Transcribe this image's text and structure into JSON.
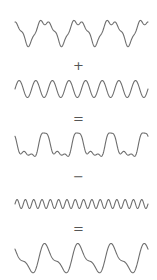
{
  "diagram": {
    "stroke_color": "#6e6e6e",
    "operator_color": "#555555",
    "x_start": 15,
    "x_end": 148,
    "waves": [
      {
        "id": "wave-1",
        "y_center": 31,
        "components": [
          {
            "periods": 4,
            "amp": 11,
            "phase": 0.35
          },
          {
            "periods": 8,
            "amp": 3,
            "phase": 0.9
          },
          {
            "periods": 16,
            "amp": 2,
            "phase": 0.2
          }
        ]
      },
      {
        "id": "wave-2",
        "y_center": 89,
        "components": [
          {
            "periods": 8,
            "amp": 8.5,
            "phase": 0.0
          }
        ]
      },
      {
        "id": "wave-3",
        "y_center": 147,
        "components": [
          {
            "periods": 4,
            "amp": 11,
            "phase": 0.35
          },
          {
            "periods": 8,
            "amp": 5,
            "phase": 0.5
          },
          {
            "periods": 16,
            "amp": 2,
            "phase": 0.2
          }
        ]
      },
      {
        "id": "wave-4",
        "y_center": 204,
        "components": [
          {
            "periods": 16,
            "amp": 4.5,
            "phase": 0.0
          }
        ]
      },
      {
        "id": "wave-5",
        "y_center": 259,
        "components": [
          {
            "periods": 4,
            "amp": 12,
            "phase": 0.3
          },
          {
            "periods": 8,
            "amp": 5,
            "phase": 0.55
          }
        ]
      }
    ],
    "operators": [
      {
        "symbol": "+",
        "y": 59
      },
      {
        "symbol": "=",
        "y": 112
      },
      {
        "symbol": "−",
        "y": 170
      },
      {
        "symbol": "=",
        "y": 222
      }
    ]
  }
}
